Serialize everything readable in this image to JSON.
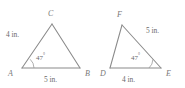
{
  "figure": {
    "background_color": "#ffffff",
    "stroke_color": "#8a8a8a",
    "text_color": "#6e6e6e",
    "triangles": [
      {
        "id": "triangle-abc",
        "vertices": [
          {
            "label": "A",
            "x": 22,
            "y": 68
          },
          {
            "label": "B",
            "x": 80,
            "y": 68
          },
          {
            "label": "C",
            "x": 52,
            "y": 24
          }
        ],
        "side_labels": [
          {
            "text": "4 in.",
            "side": "AC"
          },
          {
            "text": "5 in.",
            "side": "AB"
          }
        ],
        "angle_label": {
          "text": "47",
          "degree": "°",
          "at_vertex": "A"
        }
      },
      {
        "id": "triangle-def",
        "vertices": [
          {
            "label": "D",
            "x": 110,
            "y": 68
          },
          {
            "label": "E",
            "x": 161,
            "y": 68
          },
          {
            "label": "F",
            "x": 122,
            "y": 25
          }
        ],
        "side_labels": [
          {
            "text": "5 in.",
            "side": "FE"
          },
          {
            "text": "4 in.",
            "side": "DE"
          }
        ],
        "angle_label": {
          "text": "47",
          "degree": "°",
          "at_vertex": "E"
        }
      }
    ]
  },
  "labels": {
    "left": {
      "vertex_a": "A",
      "vertex_b": "B",
      "vertex_c": "C",
      "side_left": "4 in.",
      "side_bottom": "5 in.",
      "angle_value": "47",
      "angle_degree": "°"
    },
    "right": {
      "vertex_d": "D",
      "vertex_e": "E",
      "vertex_f": "F",
      "side_right": "5 in.",
      "side_bottom": "4 in.",
      "angle_value": "47",
      "angle_degree": "°"
    }
  }
}
